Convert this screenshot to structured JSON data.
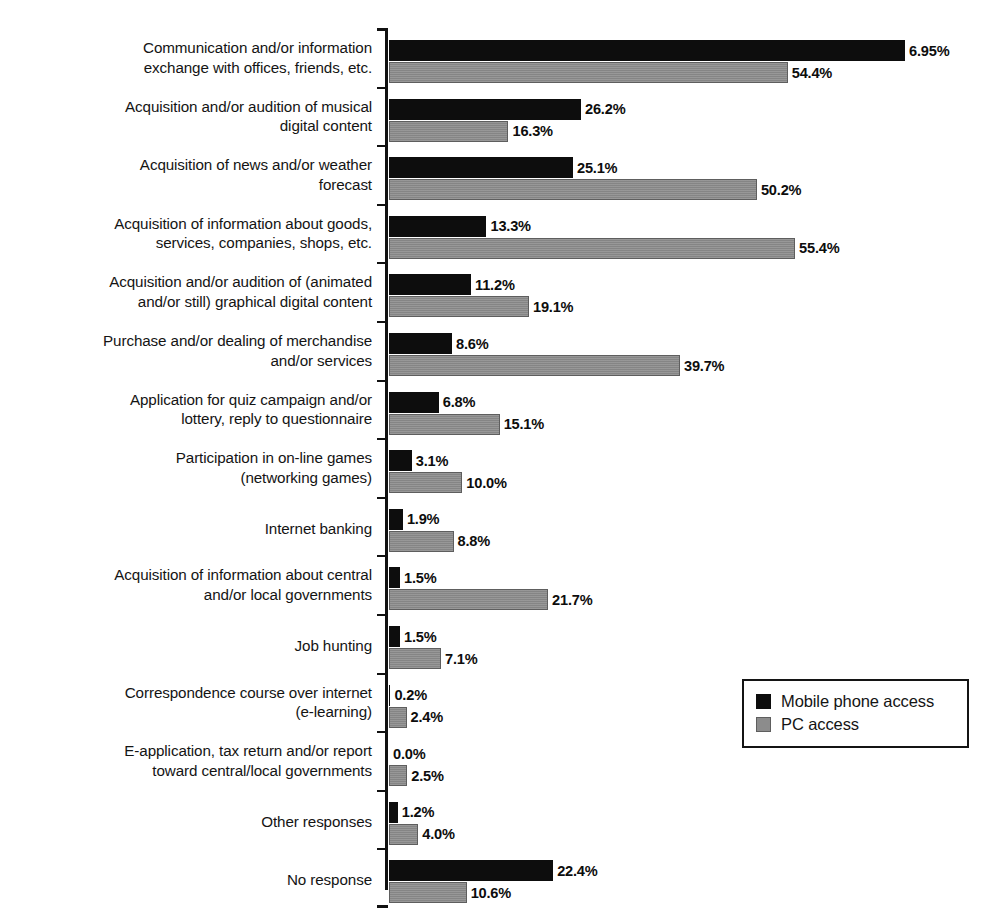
{
  "chart_data": {
    "type": "bar",
    "orientation": "horizontal",
    "title": "",
    "subtitle": "",
    "xlabel": "",
    "ylabel": "",
    "grid": false,
    "axis_line": "left",
    "value_label_suffix": "%",
    "xlim": [
      0,
      80
    ],
    "legend_position": "right-lower",
    "categories": [
      "Communication and/or information\nexchange with offices, friends, etc.",
      "Acquisition and/or audition of musical\ndigital content",
      "Acquisition of news and/or weather\nforecast",
      "Acquisition of information about goods,\nservices, companies, shops, etc.",
      "Acquisition and/or audition of (animated\nand/or still) graphical digital content",
      "Purchase and/or dealing of merchandise\nand/or services",
      "Application for quiz campaign and/or\nlottery, reply to questionnaire",
      "Participation in on-line games\n(networking games)",
      "Internet banking",
      "Acquisition of information about central\nand/or local governments",
      "Job hunting",
      "Correspondence course over internet\n(e-learning)",
      "E-application, tax return and/or report\ntoward central/local governments",
      "Other responses",
      "No response"
    ],
    "series": [
      {
        "name": "Mobile phone access",
        "color": "#0d0d0d",
        "values": [
          70.4,
          26.2,
          25.1,
          13.3,
          11.2,
          8.6,
          6.8,
          3.1,
          1.9,
          1.5,
          1.5,
          0.2,
          0.0,
          1.2,
          22.4
        ],
        "labels": [
          "6.95%",
          "26.2%",
          "25.1%",
          "13.3%",
          "11.2%",
          "8.6%",
          "6.8%",
          "3.1%",
          "1.9%",
          "1.5%",
          "1.5%",
          "0.2%",
          "0.0%",
          "1.2%",
          "22.4%"
        ]
      },
      {
        "name": "PC access",
        "color": "#8c8c8c",
        "values": [
          54.4,
          16.3,
          50.2,
          55.4,
          19.1,
          39.7,
          15.1,
          10.0,
          8.8,
          21.7,
          7.1,
          2.4,
          2.5,
          4.0,
          10.6
        ],
        "labels": [
          "54.4%",
          "16.3%",
          "50.2%",
          "55.4%",
          "19.1%",
          "39.7%",
          "15.1%",
          "10.0%",
          "8.8%",
          "21.7%",
          "7.1%",
          "2.4%",
          "2.5%",
          "4.0%",
          "10.6%"
        ]
      }
    ]
  },
  "legend": {
    "items": [
      {
        "label": "Mobile phone access",
        "swatch": "mobile"
      },
      {
        "label": "PC access",
        "swatch": "pc"
      }
    ]
  }
}
